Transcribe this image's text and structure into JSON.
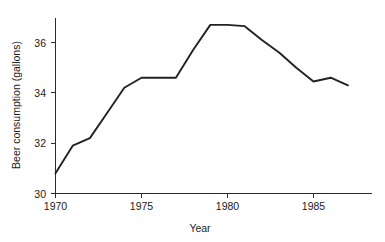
{
  "chart_data": {
    "type": "line",
    "title": "",
    "xlabel": "Year",
    "ylabel": "Beer consumption (gallons)",
    "xlim": [
      1970,
      1987.5
    ],
    "ylim": [
      30,
      37.2
    ],
    "xticks": [
      1970,
      1975,
      1980,
      1985
    ],
    "xticklabels": [
      "1970",
      "1975",
      "1980",
      "1985"
    ],
    "yticks": [
      30,
      32,
      34,
      36
    ],
    "yticklabels": [
      "30",
      "32",
      "34",
      "36"
    ],
    "grid": false,
    "legend": false,
    "series": [
      {
        "name": "Beer consumption",
        "x": [
          1970,
          1971,
          1972,
          1973,
          1974,
          1975,
          1976,
          1977,
          1978,
          1979,
          1980,
          1981,
          1982,
          1983,
          1984,
          1985,
          1986,
          1987
        ],
        "values": [
          30.8,
          31.9,
          32.2,
          33.2,
          34.2,
          34.6,
          34.6,
          34.6,
          35.7,
          36.7,
          36.7,
          36.65,
          36.1,
          35.6,
          35.0,
          34.45,
          34.6,
          34.3
        ]
      }
    ]
  },
  "axes": {
    "y_axis_title": "Beer consumption (gallons)",
    "x_axis_title": "Year"
  },
  "colors": {
    "line": "#222222",
    "axis": "#2b2b2b",
    "text": "#1a1a1a",
    "background": "#ffffff"
  }
}
